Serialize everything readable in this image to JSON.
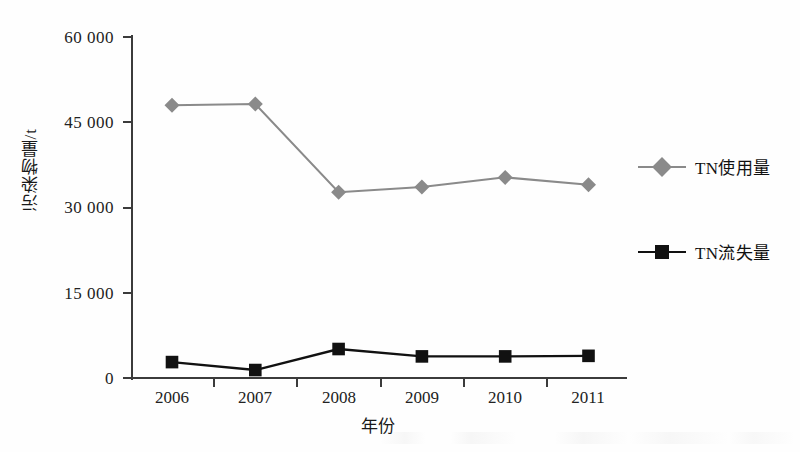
{
  "chart_data": {
    "type": "line",
    "title": "",
    "xlabel": "年份",
    "ylabel": "污染物量/t",
    "categories": [
      "2006",
      "2007",
      "2008",
      "2009",
      "2010",
      "2011"
    ],
    "x": [
      2006,
      2007,
      2008,
      2009,
      2010,
      2011
    ],
    "ylim": [
      0,
      60000
    ],
    "yticks": [
      0,
      15000,
      30000,
      45000,
      60000
    ],
    "ytick_labels": [
      "0",
      "15 000",
      "30 000",
      "45 000",
      "60 000"
    ],
    "grid": false,
    "legend_position": "right",
    "series": [
      {
        "name": "TN使用量",
        "marker": "diamond",
        "color": "#8a8a8a",
        "values": [
          48000,
          48200,
          32700,
          33600,
          35300,
          34000
        ]
      },
      {
        "name": "TN流失量",
        "marker": "square",
        "color": "#111111",
        "values": [
          2800,
          1400,
          5100,
          3800,
          3800,
          3900
        ]
      }
    ]
  },
  "axes": {
    "x_title": "年份",
    "y_title": "污染物量/t",
    "x_tick_labels": [
      "2006",
      "2007",
      "2008",
      "2009",
      "2010",
      "2011"
    ],
    "y_tick_labels": [
      "0",
      "15 000",
      "30 000",
      "45 000",
      "60 000"
    ]
  },
  "legend": {
    "items": [
      {
        "label": "TN使用量",
        "color": "#8a8a8a",
        "marker": "diamond-icon"
      },
      {
        "label": "TN流失量",
        "color": "#111111",
        "marker": "square-icon"
      }
    ]
  },
  "colors": {
    "series_tn_usage": "#8a8a8a",
    "series_tn_loss": "#111111",
    "axis": "#3b3b3b",
    "background": "#fefefe"
  }
}
